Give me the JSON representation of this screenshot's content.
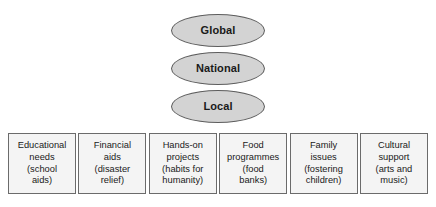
{
  "diagram": {
    "type": "hierarchy-with-categories",
    "colors": {
      "ellipse_fill": "#d3d3d3",
      "ellipse_stroke": "#5d5d5d",
      "box_fill": "#f4f4f4",
      "box_stroke": "#6b6b6b",
      "text": "#1a1a1a",
      "background": "#ffffff"
    },
    "levels": [
      {
        "id": "global",
        "label": "Global"
      },
      {
        "id": "national",
        "label": "National"
      },
      {
        "id": "local",
        "label": "Local"
      }
    ],
    "activities": [
      {
        "id": "educational-needs",
        "lines": [
          "Educational",
          "needs",
          "(school",
          "aids)"
        ]
      },
      {
        "id": "financial-aids",
        "lines": [
          "Financial",
          "aids",
          "(disaster",
          "relief)"
        ]
      },
      {
        "id": "hands-on-projects",
        "lines": [
          "Hands-on",
          "projects",
          "(habits for",
          "humanity)"
        ]
      },
      {
        "id": "food-programmes",
        "lines": [
          "Food",
          "programmes",
          "(food",
          "banks)"
        ]
      },
      {
        "id": "family-issues",
        "lines": [
          "Family",
          "issues",
          "(fostering",
          "children)"
        ]
      },
      {
        "id": "cultural-support",
        "lines": [
          "Cultural",
          "support",
          "(arts and",
          "music)"
        ]
      }
    ]
  }
}
